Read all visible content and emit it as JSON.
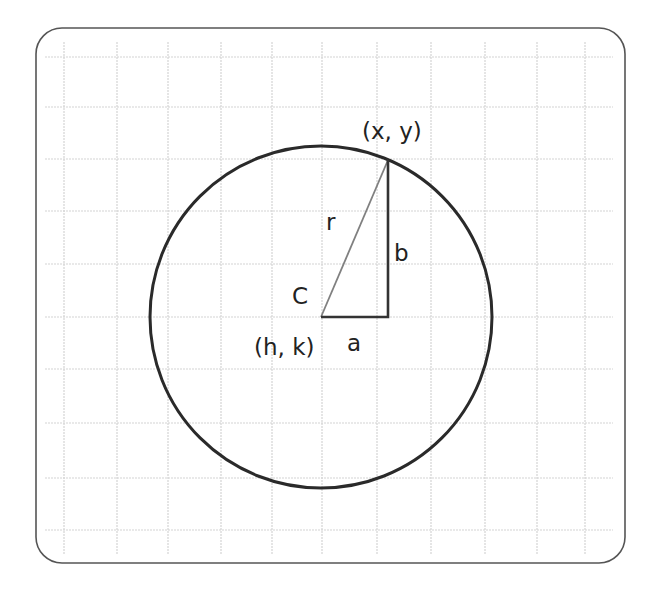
{
  "diagram": {
    "labels": {
      "point": "(x, y)",
      "radius": "r",
      "vertical_leg": "b",
      "center_letter": "C",
      "center_coords": "(h, k)",
      "horizontal_leg": "a"
    },
    "colors": {
      "border": "#555555",
      "grid": "#d4d4d4",
      "circle": "#2a2a2a",
      "legs": "#333333",
      "radius_line": "#808080",
      "text": "#222222"
    },
    "geometry": {
      "center": [
        321,
        317
      ],
      "radius": 171,
      "point": [
        388,
        160
      ]
    },
    "grid": {
      "vertical_lines_x": [
        64,
        117,
        168,
        221,
        272,
        322,
        377,
        431,
        485,
        537,
        585
      ],
      "horizontal_lines_y": [
        57,
        107,
        159,
        211,
        264,
        317,
        369,
        423,
        478,
        530
      ]
    }
  }
}
